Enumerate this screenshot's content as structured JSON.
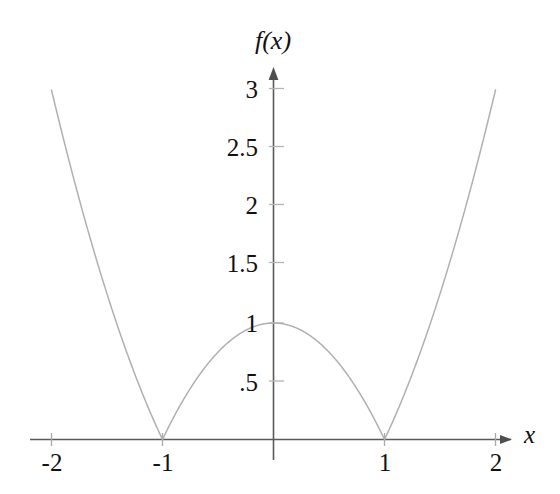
{
  "chart_data": {
    "type": "line",
    "title": "",
    "subtitle": "",
    "xlabel": "x",
    "ylabel": "f(x)",
    "expression": "f(x) = |x^2 - 1|",
    "xlim": [
      -2.0,
      2.0
    ],
    "ylim": [
      0,
      3.1
    ],
    "grid": false,
    "legend": null,
    "legend_position": "none",
    "xticks": [
      -2,
      -1,
      1,
      2
    ],
    "xtick_labels": [
      "-2",
      "-1",
      "1",
      "2"
    ],
    "yticks": [
      0.5,
      1,
      1.5,
      2,
      2.5,
      3
    ],
    "ytick_labels": [
      ".5",
      "1",
      "1.5",
      "2",
      "2.5",
      "3"
    ],
    "series": [
      {
        "name": "f(x) = |x^2 - 1|",
        "color": "#b0b0b0",
        "x": [
          -2.0,
          -1.9,
          -1.8,
          -1.7,
          -1.6,
          -1.5,
          -1.4,
          -1.3,
          -1.2,
          -1.1,
          -1.0,
          -0.9,
          -0.8,
          -0.7,
          -0.6,
          -0.5,
          -0.4,
          -0.3,
          -0.2,
          -0.1,
          0.0,
          0.1,
          0.2,
          0.3,
          0.4,
          0.5,
          0.6,
          0.7,
          0.8,
          0.9,
          1.0,
          1.1,
          1.2,
          1.3,
          1.4,
          1.5,
          1.6,
          1.7,
          1.8,
          1.9,
          2.0
        ],
        "y": [
          3.0,
          2.61,
          2.24,
          1.89,
          1.56,
          1.25,
          0.96,
          0.69,
          0.44,
          0.21,
          0.0,
          0.19,
          0.36,
          0.51,
          0.64,
          0.75,
          0.84,
          0.91,
          0.96,
          0.99,
          1.0,
          0.99,
          0.96,
          0.91,
          0.84,
          0.75,
          0.64,
          0.51,
          0.36,
          0.19,
          0.0,
          0.21,
          0.44,
          0.69,
          0.96,
          1.25,
          1.56,
          1.89,
          2.24,
          2.61,
          3.0
        ]
      }
    ],
    "key_points": {
      "roots": [
        -1,
        1
      ],
      "local_max": {
        "x": 0,
        "y": 1
      },
      "corner_points": [
        -1,
        1
      ]
    }
  },
  "axes": {
    "x_axis_name": "x",
    "y_axis_name": "f(x)",
    "axis_color": "#5a5a5a",
    "tick_color": "#b8b8b8",
    "curve_color": "#b0b0b0",
    "background_color": "#ffffff"
  },
  "ticks": {
    "y": [
      {
        "label": "3",
        "value": 3
      },
      {
        "label": "2.5",
        "value": 2.5
      },
      {
        "label": "2",
        "value": 2
      },
      {
        "label": "1.5",
        "value": 1.5
      },
      {
        "label": "1",
        "value": 1
      },
      {
        "label": ".5",
        "value": 0.5
      }
    ],
    "x": [
      {
        "label": "-2",
        "value": -2
      },
      {
        "label": "-1",
        "value": -1
      },
      {
        "label": "1",
        "value": 1
      },
      {
        "label": "2",
        "value": 2
      }
    ]
  }
}
